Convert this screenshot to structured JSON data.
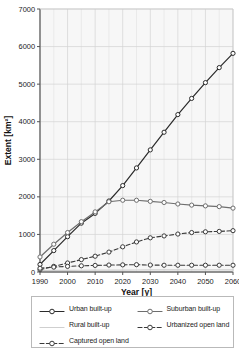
{
  "chart_data": {
    "type": "line",
    "title": "",
    "xlabel": "Year [y]",
    "ylabel": "Extent [km²]",
    "xlim": [
      1990,
      2060
    ],
    "ylim": [
      0,
      7000
    ],
    "xticks": [
      1990,
      2000,
      2010,
      2020,
      2030,
      2040,
      2050,
      2060
    ],
    "yticks": [
      0,
      1000,
      2000,
      3000,
      4000,
      5000,
      6000,
      7000
    ],
    "grid": true,
    "x_minor_step": 5,
    "legend_position": "below-outside",
    "legend_columns": 2,
    "x": [
      1990,
      1995,
      2000,
      2005,
      2010,
      2015,
      2020,
      2025,
      2030,
      2035,
      2040,
      2045,
      2050,
      2055,
      2060
    ],
    "series": [
      {
        "name": "Urban built-up",
        "color": "#2b2b2b",
        "linestyle": "solid",
        "marker": "open-circle",
        "values": [
          200,
          570,
          940,
          1300,
          1560,
          1890,
          2300,
          2770,
          3250,
          3720,
          4190,
          4620,
          5040,
          5440,
          5820
        ]
      },
      {
        "name": "Suburban built-up",
        "color": "#6e6e6e",
        "linestyle": "solid",
        "marker": "open-circle",
        "values": [
          400,
          740,
          1050,
          1340,
          1600,
          1870,
          1910,
          1910,
          1880,
          1850,
          1810,
          1780,
          1760,
          1740,
          1700
        ]
      },
      {
        "name": "Rural built-up",
        "color": "#cfcfcf",
        "linestyle": "solid",
        "marker": "none",
        "values": [
          40,
          42,
          44,
          46,
          48,
          50,
          52,
          53,
          54,
          55,
          56,
          56,
          57,
          57,
          58
        ]
      },
      {
        "name": "Urbanized open land",
        "color": "#3a3a3a",
        "linestyle": "dashed",
        "marker": "open-circle",
        "values": [
          60,
          150,
          240,
          330,
          420,
          530,
          670,
          800,
          910,
          960,
          1010,
          1050,
          1070,
          1080,
          1100
        ]
      },
      {
        "name": "Captured open land",
        "color": "#3a3a3a",
        "linestyle": "dashed",
        "marker": "open-circle",
        "values": [
          100,
          130,
          150,
          165,
          175,
          185,
          190,
          195,
          185,
          180,
          180,
          180,
          180,
          180,
          180
        ]
      }
    ]
  },
  "legend": {
    "entries": [
      {
        "label": "Urban built-up",
        "series_index": 0
      },
      {
        "label": "Suburban built-up",
        "series_index": 1
      },
      {
        "label": "Rural built-up",
        "series_index": 2
      },
      {
        "label": "Urbanized open land",
        "series_index": 3
      },
      {
        "label": "Captured open land",
        "series_index": 4
      }
    ]
  }
}
